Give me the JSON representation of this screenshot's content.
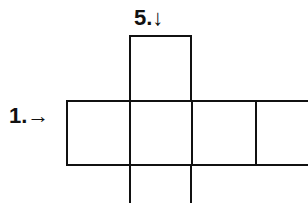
{
  "clues": [
    {
      "number_label": "5.",
      "direction": "down",
      "arrow": "↓"
    },
    {
      "number_label": "1.",
      "direction": "across",
      "arrow": "→"
    }
  ],
  "grid": {
    "cells": [
      {
        "id": "top",
        "x": 129,
        "y": 35,
        "w": 63,
        "h": 67
      },
      {
        "id": "row-1",
        "x": 66,
        "y": 100,
        "w": 65,
        "h": 66
      },
      {
        "id": "row-2",
        "x": 129,
        "y": 100,
        "w": 64,
        "h": 66
      },
      {
        "id": "row-3",
        "x": 191,
        "y": 100,
        "w": 66,
        "h": 66
      },
      {
        "id": "row-4",
        "x": 255,
        "y": 100,
        "w": 60,
        "h": 66
      },
      {
        "id": "bottom",
        "x": 129,
        "y": 164,
        "w": 63,
        "h": 50
      }
    ],
    "border_color": "#111111"
  }
}
